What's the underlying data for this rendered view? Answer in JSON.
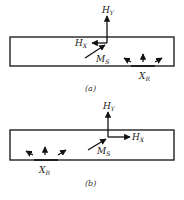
{
  "figure": {
    "panels": [
      {
        "id": "a",
        "caption": "(a)",
        "labels": {
          "hy": "H",
          "hy_sub": "Y",
          "hx": "H",
          "hx_sub": "X",
          "ms": "M",
          "ms_sub": "S",
          "xr": "X",
          "xr_sub": "R"
        },
        "hx_direction": "left",
        "xr_position": "right"
      },
      {
        "id": "b",
        "caption": "(b)",
        "labels": {
          "hy": "H",
          "hy_sub": "Y",
          "hx": "H",
          "hx_sub": "X",
          "ms": "M",
          "ms_sub": "S",
          "xr": "X",
          "xr_sub": "R"
        },
        "hx_direction": "right",
        "xr_position": "left"
      }
    ],
    "colors": {
      "ink": "#111111",
      "background": "#ffffff"
    }
  }
}
